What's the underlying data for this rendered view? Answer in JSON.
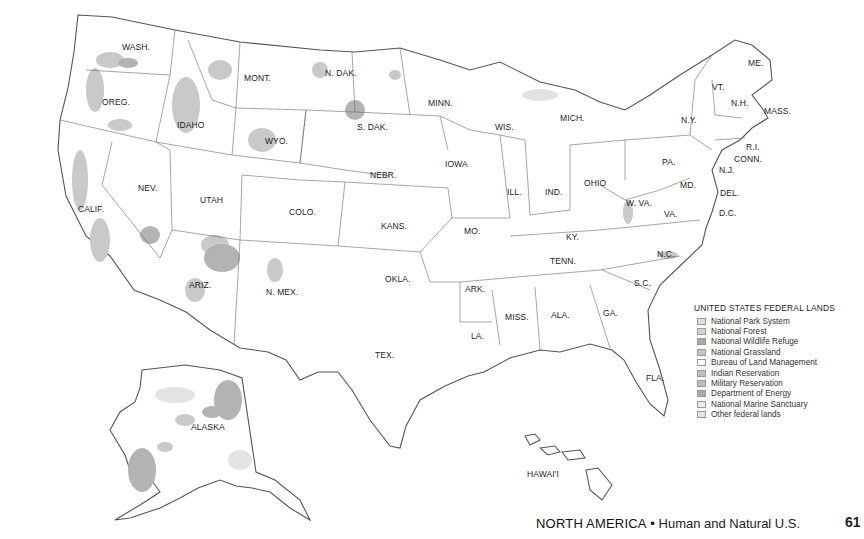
{
  "map": {
    "title": "UNITED STATES FEDERAL LANDS",
    "state_labels": [
      {
        "id": "wash",
        "text": "WASH.",
        "x": 122,
        "y": 50
      },
      {
        "id": "oreg",
        "text": "OREG.",
        "x": 102,
        "y": 105
      },
      {
        "id": "calif",
        "text": "CALIF.",
        "x": 78,
        "y": 212
      },
      {
        "id": "idaho",
        "text": "IDAHO",
        "x": 177,
        "y": 128
      },
      {
        "id": "nev",
        "text": "NEV.",
        "x": 138,
        "y": 191
      },
      {
        "id": "mont",
        "text": "MONT.",
        "x": 244,
        "y": 81
      },
      {
        "id": "wyo",
        "text": "WYO.",
        "x": 265,
        "y": 144
      },
      {
        "id": "utah",
        "text": "UTAH",
        "x": 200,
        "y": 203
      },
      {
        "id": "colo",
        "text": "COLO.",
        "x": 289,
        "y": 215
      },
      {
        "id": "ariz",
        "text": "ARIZ.",
        "x": 189,
        "y": 288
      },
      {
        "id": "nmex",
        "text": "N. MEX.",
        "x": 266,
        "y": 295
      },
      {
        "id": "ndak",
        "text": "N. DAK.",
        "x": 325,
        "y": 76
      },
      {
        "id": "sdak",
        "text": "S. DAK.",
        "x": 357,
        "y": 130
      },
      {
        "id": "nebr",
        "text": "NEBR.",
        "x": 370,
        "y": 178
      },
      {
        "id": "kans",
        "text": "KANS.",
        "x": 381,
        "y": 229
      },
      {
        "id": "okla",
        "text": "OKLA.",
        "x": 385,
        "y": 282
      },
      {
        "id": "tex",
        "text": "TEX.",
        "x": 375,
        "y": 358
      },
      {
        "id": "minn",
        "text": "MINN.",
        "x": 428,
        "y": 106
      },
      {
        "id": "iowa",
        "text": "IOWA",
        "x": 445,
        "y": 167
      },
      {
        "id": "mo",
        "text": "MO.",
        "x": 464,
        "y": 234
      },
      {
        "id": "ark",
        "text": "ARK.",
        "x": 465,
        "y": 292
      },
      {
        "id": "la",
        "text": "LA.",
        "x": 471,
        "y": 339
      },
      {
        "id": "wis",
        "text": "WIS.",
        "x": 495,
        "y": 130
      },
      {
        "id": "ill",
        "text": "ILL.",
        "x": 507,
        "y": 195
      },
      {
        "id": "mich",
        "text": "MICH.",
        "x": 560,
        "y": 121
      },
      {
        "id": "ind",
        "text": "IND.",
        "x": 545,
        "y": 195
      },
      {
        "id": "ohio",
        "text": "OHIO",
        "x": 584,
        "y": 186
      },
      {
        "id": "ky",
        "text": "KY.",
        "x": 566,
        "y": 240
      },
      {
        "id": "tenn",
        "text": "TENN.",
        "x": 550,
        "y": 264
      },
      {
        "id": "miss",
        "text": "MISS.",
        "x": 505,
        "y": 320
      },
      {
        "id": "ala",
        "text": "ALA.",
        "x": 551,
        "y": 318
      },
      {
        "id": "ga",
        "text": "GA.",
        "x": 603,
        "y": 316
      },
      {
        "id": "fla",
        "text": "FLA.",
        "x": 646,
        "y": 381
      },
      {
        "id": "sc",
        "text": "S.C.",
        "x": 634,
        "y": 286
      },
      {
        "id": "nc",
        "text": "N.C.",
        "x": 657,
        "y": 257
      },
      {
        "id": "va",
        "text": "VA.",
        "x": 664,
        "y": 217
      },
      {
        "id": "wva",
        "text": "W. VA.",
        "x": 626,
        "y": 206
      },
      {
        "id": "pa",
        "text": "PA.",
        "x": 662,
        "y": 165
      },
      {
        "id": "ny",
        "text": "N.Y.",
        "x": 681,
        "y": 123
      },
      {
        "id": "md",
        "text": "MD.",
        "x": 680,
        "y": 188
      },
      {
        "id": "de",
        "text": "DEL.",
        "x": 720,
        "y": 196
      },
      {
        "id": "dc",
        "text": "D.C.",
        "x": 719,
        "y": 216
      },
      {
        "id": "nj",
        "text": "N.J.",
        "x": 719,
        "y": 173
      },
      {
        "id": "conn",
        "text": "CONN.",
        "x": 734,
        "y": 162
      },
      {
        "id": "ri",
        "text": "R.I.",
        "x": 746,
        "y": 150
      },
      {
        "id": "mass",
        "text": "MASS.",
        "x": 764,
        "y": 114
      },
      {
        "id": "nh",
        "text": "N.H.",
        "x": 731,
        "y": 106
      },
      {
        "id": "vt",
        "text": "VT.",
        "x": 712,
        "y": 90
      },
      {
        "id": "me",
        "text": "ME.",
        "x": 748,
        "y": 66
      },
      {
        "id": "alaska",
        "text": "ALASKA",
        "x": 191,
        "y": 430
      },
      {
        "id": "hawaii",
        "text": "HAWAI'I",
        "x": 527,
        "y": 477
      }
    ]
  },
  "legend": {
    "title": "UNITED STATES FEDERAL LANDS",
    "items": [
      {
        "label": "National Park System",
        "color": "#dcdcdc"
      },
      {
        "label": "National Forest",
        "color": "#d2d2d2"
      },
      {
        "label": "National Wildlife Refuge",
        "color": "#a8a8a8"
      },
      {
        "label": "National Grassland",
        "color": "#c4c4c4"
      },
      {
        "label": "Bureau of Land Management",
        "color": "#ffffff"
      },
      {
        "label": "Indian Reservation",
        "color": "#bdbdbd"
      },
      {
        "label": "Military Reservation",
        "color": "#bcbcbc"
      },
      {
        "label": "Department of Energy",
        "color": "#ababab"
      },
      {
        "label": "National Marine Sanctuary",
        "color": "#ececec"
      },
      {
        "label": "Other federal lands",
        "color": "#e6e6e6"
      }
    ]
  },
  "footer": {
    "region": "NORTH AMERICA",
    "bullet": "•",
    "subtitle": "Human and Natural U.S.",
    "page_number": "61"
  }
}
